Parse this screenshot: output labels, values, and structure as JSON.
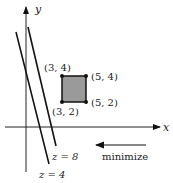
{
  "axes": {
    "x_label": "x",
    "y_label": "y"
  },
  "region": {
    "corners": [
      {
        "label": "(3, 4)",
        "x": 3,
        "y": 4
      },
      {
        "label": "(5, 4)",
        "x": 5,
        "y": 4
      },
      {
        "label": "(3, 2)",
        "x": 3,
        "y": 2
      },
      {
        "label": "(5, 2)",
        "x": 5,
        "y": 2
      }
    ],
    "fill": "#9a9a9a"
  },
  "level_lines": [
    {
      "label": "z = 8"
    },
    {
      "label": "z = 4"
    }
  ],
  "direction": {
    "label": "minimize"
  }
}
